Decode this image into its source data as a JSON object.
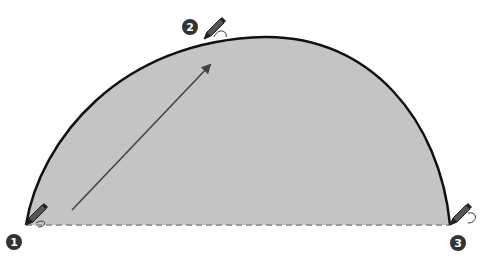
{
  "diagram": {
    "type": "three-point-arc",
    "colors": {
      "fill": "#c4c4c4",
      "arc_stroke": "#111111",
      "baseline": "#9a9a9a",
      "arrow": "#444444",
      "badge": "#333333",
      "badge_text": "#ffffff",
      "pencil": "#333333"
    },
    "points": [
      {
        "label": "1",
        "x": 26,
        "y": 225,
        "badge_x": 14,
        "badge_y": 242
      },
      {
        "label": "2",
        "x": 204,
        "y": 39,
        "badge_x": 190,
        "badge_y": 27
      },
      {
        "label": "3",
        "x": 450,
        "y": 225,
        "badge_x": 458,
        "badge_y": 243
      }
    ],
    "arc_path": "M26,225 C40,140 120,40 265,37 C370,36 440,120 450,225",
    "fill_path": "M26,225 C40,140 120,40 265,37 C370,36 440,120 450,225 Z",
    "baseline": {
      "x1": 26,
      "y1": 225,
      "x2": 450,
      "y2": 225
    },
    "arrow": {
      "x1": 72,
      "y1": 210,
      "x2": 210,
      "y2": 65
    }
  }
}
